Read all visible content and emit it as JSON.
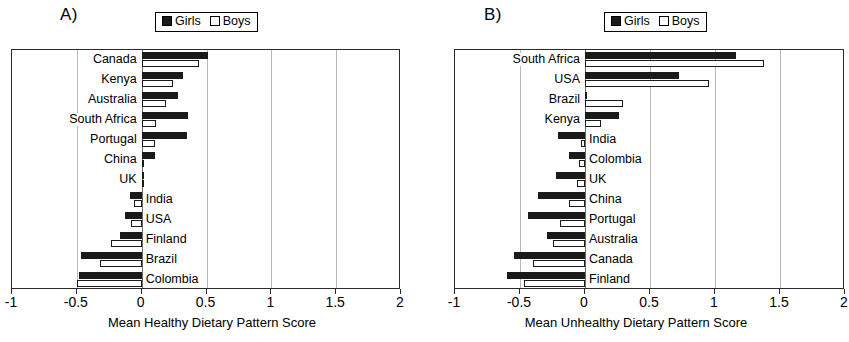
{
  "figure": {
    "panels": [
      {
        "label": "A)",
        "legend": [
          {
            "name": "Girls",
            "marker": "filled-square"
          },
          {
            "name": "Boys",
            "marker": "hollow-square"
          }
        ],
        "chart_data": {
          "type": "bar",
          "orientation": "horizontal",
          "title": "",
          "xlabel": "Mean Healthy Dietary Pattern Score",
          "ylabel": "",
          "xlim": [
            -1,
            2
          ],
          "xticks": [
            -1,
            -0.5,
            0,
            0.5,
            1,
            1.5,
            2
          ],
          "xtick_labels": [
            "-1",
            "-0.5",
            "0",
            "0.5",
            "1",
            "1.5",
            "2"
          ],
          "grid": true,
          "legend_position": "top-center",
          "categories": [
            "Canada",
            "Kenya",
            "Australia",
            "South Africa",
            "Portugal",
            "China",
            "UK",
            "India",
            "USA",
            "Finland",
            "Brazil",
            "Colombia"
          ],
          "series": [
            {
              "name": "Girls",
              "color": "#1a1a1a",
              "values": [
                0.51,
                0.32,
                0.28,
                0.36,
                0.35,
                0.1,
                0.01,
                -0.09,
                -0.13,
                -0.17,
                -0.47,
                -0.48
              ]
            },
            {
              "name": "Boys",
              "color": "#ffffff",
              "values": [
                0.44,
                0.24,
                0.19,
                0.11,
                0.1,
                0.02,
                0.0,
                -0.06,
                -0.08,
                -0.24,
                -0.32,
                -0.5
              ]
            }
          ]
        }
      },
      {
        "label": "B)",
        "legend": [
          {
            "name": "Girls",
            "marker": "filled-square"
          },
          {
            "name": "Boys",
            "marker": "hollow-square"
          }
        ],
        "chart_data": {
          "type": "bar",
          "orientation": "horizontal",
          "title": "",
          "xlabel": "Mean Unhealthy Dietary Pattern Score",
          "ylabel": "",
          "xlim": [
            -1,
            2
          ],
          "xticks": [
            -1,
            -0.5,
            0,
            0.5,
            1,
            1.5,
            2
          ],
          "xtick_labels": [
            "-1",
            "-0.5",
            "0",
            "0.5",
            "1",
            "1.5",
            "2"
          ],
          "grid": true,
          "legend_position": "top-center",
          "categories": [
            "South Africa",
            "USA",
            "Brazil",
            "Kenya",
            "India",
            "Colombia",
            "UK",
            "China",
            "Portugal",
            "Australia",
            "Canada",
            "Finland"
          ],
          "series": [
            {
              "name": "Girls",
              "color": "#1a1a1a",
              "values": [
                1.16,
                0.72,
                0.0,
                0.26,
                -0.21,
                -0.12,
                -0.22,
                -0.36,
                -0.44,
                -0.29,
                -0.55,
                -0.6
              ]
            },
            {
              "name": "Boys",
              "color": "#ffffff",
              "values": [
                1.38,
                0.95,
                0.29,
                0.12,
                -0.03,
                -0.05,
                -0.06,
                -0.12,
                -0.19,
                -0.25,
                -0.4,
                -0.47
              ]
            }
          ]
        }
      }
    ]
  }
}
